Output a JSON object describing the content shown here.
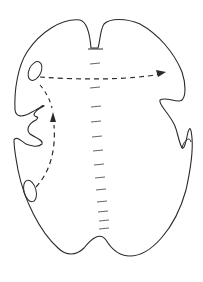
{
  "diagram": {
    "type": "line-drawing",
    "colors": {
      "background": "#ffffff",
      "stroke": "#2a2a2a",
      "midline": "#555555"
    },
    "elements": {
      "outline": "outer-contour",
      "top_notch": "dorsal-cleft",
      "bottom_notch": "ventral-cleft",
      "midline_marks_count": 14,
      "ovals": [
        "upper-left-oval",
        "lower-left-oval"
      ],
      "arrows": [
        "horizontal-dashed-arrow",
        "vertical-dashed-arrow"
      ]
    }
  }
}
